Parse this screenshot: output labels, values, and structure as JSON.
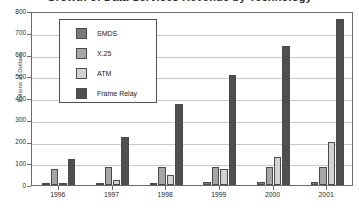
{
  "chart_data": {
    "type": "bar",
    "title": "Growth of Data Services Revenue by Technology",
    "xlabel": "",
    "ylabel": "Billions of Dollars",
    "ylim": [
      0,
      800
    ],
    "ytick_values": [
      0,
      100,
      200,
      300,
      400,
      500,
      600,
      700,
      800
    ],
    "ytick_labels": [
      "0",
      "100",
      "200",
      "300",
      "400",
      "500",
      "600",
      "700",
      "800"
    ],
    "categories": [
      "1996",
      "1997",
      "1998",
      "1999",
      "2000",
      "2001"
    ],
    "grid": true,
    "legend_position": "upper-left-inside",
    "series": [
      {
        "name": "SMDS",
        "color": "#7a7a7a",
        "values": [
          5,
          8,
          11,
          13,
          15,
          15
        ]
      },
      {
        "name": "X.25",
        "color": "#a6a6a6",
        "values": [
          75,
          81,
          83,
          82,
          82,
          82
        ]
      },
      {
        "name": "ATM",
        "color": "#d2d2d2",
        "values": [
          10,
          25,
          45,
          74,
          128,
          197
        ]
      },
      {
        "name": "Frame Relay",
        "color": "#4f4f4f",
        "values": [
          118,
          220,
          373,
          506,
          640,
          765
        ]
      }
    ]
  }
}
